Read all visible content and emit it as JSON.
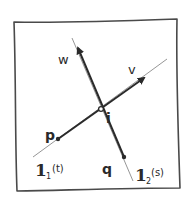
{
  "diagram": {
    "lines": [
      {
        "id": "l1",
        "label_main": "1",
        "label_sub": "1",
        "label_param": "(t)",
        "full_label": "l1(t)"
      },
      {
        "id": "l2",
        "label_main": "1",
        "label_sub": "2",
        "label_param": "(s)",
        "full_label": "l2(s)"
      }
    ],
    "points": [
      {
        "id": "p",
        "label": "p",
        "on_line": "l1"
      },
      {
        "id": "q",
        "label": "q",
        "on_line": "l2"
      },
      {
        "id": "i",
        "label": "i",
        "note": "intersection"
      }
    ],
    "vectors": [
      {
        "id": "v",
        "label": "v",
        "direction_of": "l1"
      },
      {
        "id": "w",
        "label": "w",
        "direction_of": "l2"
      }
    ],
    "colors": {
      "ink": "#2a2a2a",
      "faint_line": "#8a8a8a",
      "frame": "#4a4a4a",
      "background": "#ffffff"
    }
  }
}
